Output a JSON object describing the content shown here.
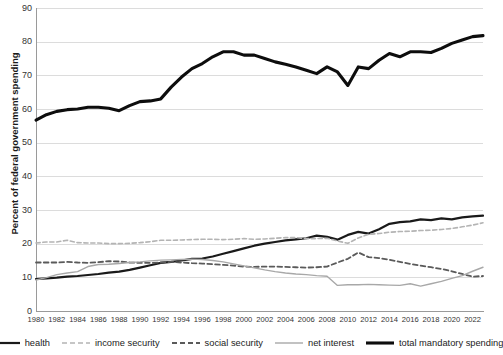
{
  "chart_data": {
    "type": "line",
    "title": "",
    "xlabel": "",
    "ylabel": "Percent of federal government spending",
    "xlim": [
      1980,
      2023
    ],
    "ylim": [
      0,
      90
    ],
    "grid": true,
    "legend_position": "bottom",
    "y_ticks": [
      0,
      10,
      20,
      30,
      40,
      50,
      60,
      70,
      80,
      90
    ],
    "x_ticks": [
      1980,
      1982,
      1984,
      1986,
      1988,
      1990,
      1992,
      1994,
      1996,
      1998,
      2000,
      2002,
      2004,
      2006,
      2008,
      2010,
      2012,
      2014,
      2016,
      2018,
      2020,
      2022
    ],
    "x": [
      1980,
      1981,
      1982,
      1983,
      1984,
      1985,
      1986,
      1987,
      1988,
      1989,
      1990,
      1991,
      1992,
      1993,
      1994,
      1995,
      1996,
      1997,
      1998,
      1999,
      2000,
      2001,
      2002,
      2003,
      2004,
      2005,
      2006,
      2007,
      2008,
      2009,
      2010,
      2011,
      2012,
      2013,
      2014,
      2015,
      2016,
      2017,
      2018,
      2019,
      2020,
      2021,
      2022,
      2023
    ],
    "series": [
      {
        "name": "health",
        "style": "solid",
        "color": "#1a1a1a",
        "width": 2.2,
        "values": [
          9.5,
          9.7,
          9.9,
          10.2,
          10.4,
          10.7,
          11.0,
          11.4,
          11.7,
          12.2,
          12.9,
          13.6,
          14.3,
          14.6,
          15.0,
          15.5,
          15.6,
          16.2,
          17.0,
          17.8,
          18.6,
          19.4,
          20.0,
          20.5,
          21.0,
          21.3,
          21.6,
          22.4,
          22.0,
          21.2,
          22.6,
          23.5,
          23.0,
          24.3,
          25.9,
          26.4,
          26.6,
          27.2,
          27.0,
          27.5,
          27.2,
          27.8,
          28.1,
          28.3
        ]
      },
      {
        "name": "income security",
        "style": "dashed",
        "color": "#b4b4b4",
        "width": 1.6,
        "values": [
          20.2,
          20.5,
          20.5,
          21.0,
          20.3,
          20.2,
          20.2,
          20.0,
          20.0,
          20.1,
          20.3,
          20.6,
          21.0,
          21.0,
          21.1,
          21.2,
          21.3,
          21.3,
          21.2,
          21.3,
          21.5,
          21.3,
          21.4,
          21.6,
          21.8,
          21.8,
          21.5,
          21.5,
          21.6,
          20.8,
          20.1,
          21.7,
          22.8,
          23.0,
          23.4,
          23.6,
          23.7,
          23.9,
          24.0,
          24.2,
          24.5,
          25.0,
          25.5,
          26.2
        ]
      },
      {
        "name": "social security",
        "style": "dashed",
        "color": "#5a5a5a",
        "width": 1.8,
        "values": [
          14.4,
          14.4,
          14.4,
          14.6,
          14.4,
          14.3,
          14.5,
          14.8,
          14.7,
          14.4,
          14.3,
          14.3,
          14.4,
          14.6,
          14.4,
          14.2,
          14.1,
          13.9,
          13.7,
          13.5,
          13.2,
          13.1,
          13.2,
          13.2,
          13.1,
          13.0,
          12.9,
          13.0,
          13.2,
          14.4,
          15.5,
          17.4,
          16.0,
          15.7,
          15.2,
          14.6,
          14.0,
          13.5,
          13.0,
          12.5,
          11.8,
          11.0,
          10.2,
          10.4
        ]
      },
      {
        "name": "net interest",
        "style": "solid",
        "color": "#a8a8a8",
        "width": 1.4,
        "values": [
          9.2,
          9.9,
          10.8,
          11.3,
          11.7,
          13.2,
          13.8,
          13.9,
          14.1,
          14.4,
          14.6,
          14.9,
          15.1,
          15.2,
          15.3,
          15.4,
          15.3,
          15.0,
          14.6,
          14.0,
          13.4,
          12.8,
          12.2,
          11.7,
          11.3,
          11.0,
          10.8,
          10.5,
          10.3,
          7.6,
          7.8,
          7.8,
          7.9,
          7.8,
          7.7,
          7.6,
          8.1,
          7.4,
          8.1,
          8.8,
          9.7,
          10.5,
          11.8,
          13.0
        ]
      },
      {
        "name": "total mandatory spending",
        "style": "solid",
        "color": "#0d0d0d",
        "width": 3.1,
        "values": [
          56.7,
          58.3,
          59.3,
          59.8,
          60.0,
          60.5,
          60.5,
          60.2,
          59.5,
          61.0,
          62.2,
          62.4,
          63.0,
          66.5,
          69.5,
          72.0,
          73.5,
          75.5,
          77.0,
          77.0,
          76.0,
          76.0,
          75.0,
          74.0,
          73.3,
          72.5,
          71.5,
          70.5,
          72.5,
          71.0,
          67.0,
          72.5,
          72.0,
          74.5,
          76.5,
          75.5,
          77.0,
          77.0,
          76.8,
          78.0,
          79.5,
          80.5,
          81.5,
          81.8
        ]
      }
    ]
  },
  "legend": {
    "items": [
      {
        "label": "health",
        "swatch": "solid-thick-black"
      },
      {
        "label": "income security",
        "swatch": "dashed-light-gray"
      },
      {
        "label": "social security",
        "swatch": "dashed-dark-gray"
      },
      {
        "label": "net interest",
        "swatch": "solid-thin-gray"
      },
      {
        "label": "total mandatory spending",
        "swatch": "solid-thickest-black"
      }
    ]
  }
}
